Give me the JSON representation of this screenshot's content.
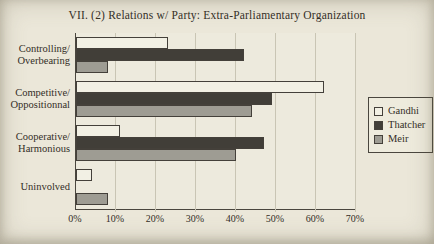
{
  "page": {
    "background_color": "#ebe7d9",
    "text_color": "#332e27"
  },
  "chart_data": {
    "type": "bar",
    "orientation": "horizontal",
    "title": "VII. (2) Relations w/ Party: Extra-Parliamentary Organization",
    "categories": [
      "Controlling/Overbearing",
      "Competitive/Oppositionnal",
      "Cooperative/Harmonious",
      "Uninvolved"
    ],
    "series": [
      {
        "name": "Gandhi",
        "color": "#f2f0e4",
        "values": [
          23,
          62,
          11,
          4
        ]
      },
      {
        "name": "Thatcher",
        "color": "#413e38",
        "values": [
          42,
          49,
          47,
          0
        ]
      },
      {
        "name": "Meir",
        "color": "#9e9c93",
        "values": [
          8,
          44,
          40,
          8
        ]
      }
    ],
    "xlim": [
      0,
      70
    ],
    "x_ticks": [
      "0%",
      "10%",
      "20%",
      "30%",
      "40%",
      "50%",
      "60%",
      "70%"
    ],
    "xlabel": "",
    "ylabel": "",
    "legend_position": "right",
    "grid": true,
    "bar_border_color": "#44403a",
    "gridline_color": "#c9c5b4",
    "axis_color": "#4a463e"
  }
}
